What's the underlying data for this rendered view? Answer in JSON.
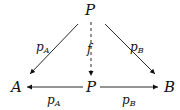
{
  "diagram": {
    "type": "commutative-diagram",
    "nodes": {
      "top": {
        "label": "P"
      },
      "left": {
        "label": "A"
      },
      "center": {
        "label": "P"
      },
      "right": {
        "label": "B"
      }
    },
    "edges": {
      "top_to_left": {
        "label_base": "p",
        "label_sub": "A",
        "style": "solid"
      },
      "top_to_right": {
        "label_base": "p",
        "label_sub": "B",
        "style": "solid"
      },
      "top_to_center": {
        "label": "f",
        "style": "dashed"
      },
      "center_to_left": {
        "label_base": "p",
        "label_sub": "A",
        "style": "solid"
      },
      "center_to_right": {
        "label_base": "p",
        "label_sub": "B",
        "style": "solid"
      }
    },
    "colors": {
      "ink": "#111111",
      "background": "#ffffff"
    }
  }
}
